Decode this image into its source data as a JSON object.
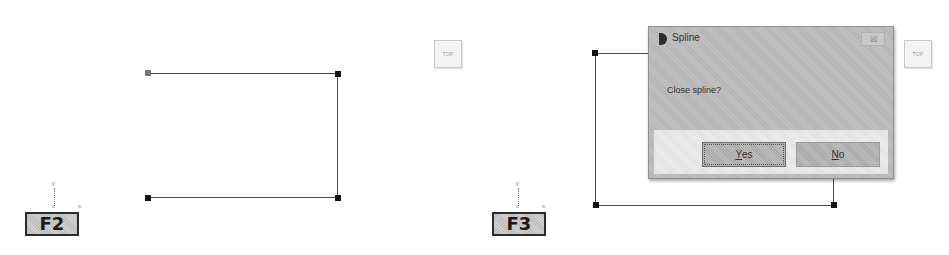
{
  "panels": [
    {
      "id": "left",
      "step_label": "F2",
      "view_cube_label": "TOP",
      "triad": {
        "y": "y",
        "z": "z",
        "x": "x"
      }
    },
    {
      "id": "right",
      "step_label": "F3",
      "view_cube_label": "TOP",
      "triad": {
        "y": "y",
        "z": "z",
        "x": "x"
      },
      "dialog": {
        "title": "Spline",
        "close_glyph": "☒",
        "message": "Close spline?",
        "buttons": [
          {
            "label_accel": "Y",
            "label_rest": "es",
            "label": "Yes",
            "default": true
          },
          {
            "label_accel": "N",
            "label_rest": "o",
            "label": "No",
            "default": false
          }
        ]
      }
    }
  ],
  "colors": {
    "line": "#4a4a4a",
    "node": "#111111",
    "dialog_bg": "#bcbcbc",
    "button_panel": "#e8e8e8"
  }
}
